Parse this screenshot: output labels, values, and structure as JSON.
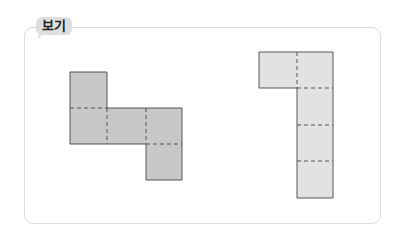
{
  "label": {
    "text": "보기"
  },
  "colors": {
    "box_border": "#dcdcdc",
    "label_bg": "#dedede",
    "shape_left_fill": "#c8c8c8",
    "shape_right_fill": "#e2e2e2",
    "shape_stroke": "#555555"
  },
  "figures": [
    {
      "name": "left-net",
      "cells": 5,
      "description": "Z-shaped net of 5 unit squares with dashed fold lines"
    },
    {
      "name": "right-net",
      "cells": 5,
      "description": "Reversed-L (ㄱ) shaped net of 5 unit squares with dashed fold lines"
    }
  ]
}
